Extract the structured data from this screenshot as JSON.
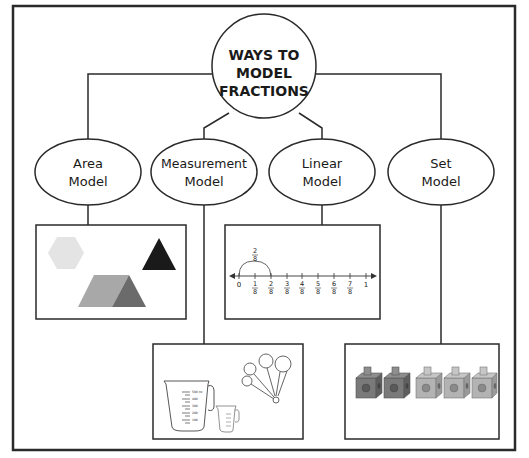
{
  "root": {
    "lines": [
      "WAYS TO",
      "MODEL",
      "FRACTIONS"
    ]
  },
  "nodes": [
    {
      "id": "area",
      "lines": [
        "Area",
        "Model"
      ]
    },
    {
      "id": "measurement",
      "lines": [
        "Measurement",
        "Model"
      ]
    },
    {
      "id": "linear",
      "lines": [
        "Linear",
        "Model"
      ]
    },
    {
      "id": "set",
      "lines": [
        "Set",
        "Model"
      ]
    }
  ],
  "linear_model": {
    "jump_label": {
      "num": "2",
      "den": "8"
    },
    "start_label": "0",
    "end_label": "1",
    "ticks": [
      {
        "num": "1",
        "den": "8"
      },
      {
        "num": "2",
        "den": "8"
      },
      {
        "num": "3",
        "den": "8"
      },
      {
        "num": "4",
        "den": "8"
      },
      {
        "num": "5",
        "den": "8"
      },
      {
        "num": "6",
        "den": "8"
      },
      {
        "num": "7",
        "den": "8"
      }
    ]
  },
  "measurement_model": {
    "large_cup_marks": [
      "500 ml",
      "400",
      "300",
      "200",
      "100"
    ]
  },
  "set_model": {
    "cubes_dark": 2,
    "cubes_light": 3
  },
  "colors": {
    "line": "#2a2a2a",
    "hexagon": "#e4e4e4",
    "triangle": "#1a1a1a",
    "trapezoid": "#a8a8a8",
    "triangle_mid": "#6b6b6b",
    "cube_dark": "#7a7a7a",
    "cube_light": "#b3b3b3"
  }
}
